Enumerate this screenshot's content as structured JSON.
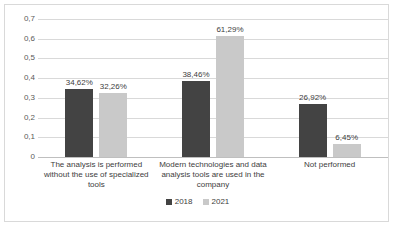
{
  "chart_data": {
    "type": "bar",
    "title": "",
    "subtitle": "",
    "xlabel": "",
    "ylabel": "",
    "ylim": [
      0,
      0.7
    ],
    "grid": true,
    "legend_position": "bottom",
    "y_ticks": [
      "0",
      "0,1",
      "0,2",
      "0,3",
      "0,4",
      "0,5",
      "0,6",
      "0,7"
    ],
    "y_tick_values": [
      0,
      0.1,
      0.2,
      0.3,
      0.4,
      0.5,
      0.6,
      0.7
    ],
    "categories": [
      "The analysis is performed without the use of specialized tools",
      "Modern technologies and data analysis tools are used in the company",
      "Not performed"
    ],
    "series": [
      {
        "name": "2018",
        "color": "#434343",
        "values": [
          0.3462,
          0.3846,
          0.2692
        ],
        "labels": [
          "34,62%",
          "38,46%",
          "26,92%"
        ]
      },
      {
        "name": "2021",
        "color": "#c9c9c9",
        "values": [
          0.3226,
          0.6129,
          0.0645
        ],
        "labels": [
          "32,26%",
          "61,29%",
          "6,45%"
        ]
      }
    ]
  },
  "legend": {
    "items": [
      {
        "label": "2018",
        "color": "#434343"
      },
      {
        "label": "2021",
        "color": "#c9c9c9"
      }
    ]
  },
  "colors": {
    "series_2018": "#434343",
    "series_2021": "#c9c9c9",
    "gridline": "#d9d9d9",
    "border": "#d9d9d9",
    "text": "#404040",
    "background": "#ffffff"
  }
}
